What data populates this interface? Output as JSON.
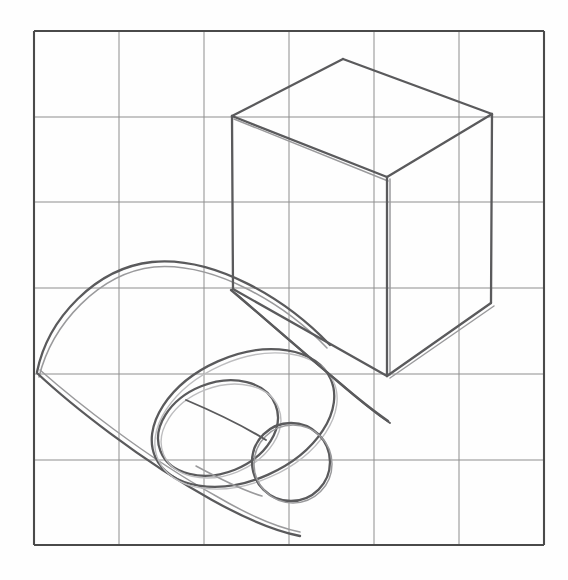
{
  "document": {
    "title": "Pencil perspective study: cube and cylinder on grid",
    "medium": "graphite pencil on paper",
    "background_color": "#fefefe",
    "pencil_color": "#5a5a5c",
    "grid_color": "#8e8e8e",
    "grid_border_color": "#4a4a4a"
  },
  "canvas": {
    "width": 568,
    "height": 580
  },
  "grid": {
    "columns": 6,
    "rows": 6,
    "left": 34,
    "top": 31,
    "right": 544,
    "bottom": 545,
    "x_positions": [
      34,
      119,
      204,
      289,
      374,
      459,
      544
    ],
    "y_positions": [
      31,
      117,
      202,
      288,
      374,
      460,
      545
    ]
  },
  "shapes": {
    "cube": {
      "name": "cube",
      "vertices": {
        "top_apex": [
          343,
          59
        ],
        "top_left": [
          232,
          116
        ],
        "top_right": [
          492,
          114
        ],
        "top_front": [
          387,
          177
        ],
        "bottom_left": [
          233,
          289
        ],
        "bottom_right": [
          491,
          303
        ],
        "bottom_front": [
          387,
          376
        ]
      },
      "edges": [
        "top_apex-top_left",
        "top_apex-top_right",
        "top_left-top_front",
        "top_right-top_front",
        "top_left-bottom_left",
        "top_right-bottom_right",
        "top_front-bottom_front",
        "bottom_left-bottom_front",
        "bottom_right-bottom_front"
      ]
    },
    "outer_cylinder": {
      "name": "outer-cylinder",
      "axis_start": [
        105,
        375
      ],
      "axis_end": [
        330,
        455
      ],
      "near_ellipse_center": [
        284,
        436
      ],
      "near_ellipse_rx": 84,
      "near_ellipse_ry": 62,
      "near_ellipse_rotation": -22,
      "far_ellipse_center": [
        105,
        375
      ],
      "far_ellipse_rx": 84,
      "far_ellipse_ry": 62,
      "far_ellipse_rotation": -22
    },
    "inner_cylinder": {
      "name": "inner-cylinder",
      "near_circle_center": [
        291,
        462
      ],
      "near_circle_radius": 39,
      "far_ellipse_center": [
        214,
        427
      ],
      "far_ellipse_rx": 55,
      "far_ellipse_ry": 41,
      "far_ellipse_rotation": -20
    }
  }
}
